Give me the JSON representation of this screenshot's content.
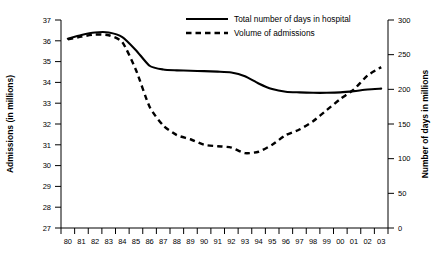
{
  "chart_data": {
    "type": "line",
    "title": "",
    "xlabel": "",
    "ylabel": "Admissions (in millions)",
    "y2label": "Number of days in millions",
    "categories": [
      "80",
      "81",
      "82",
      "83",
      "84",
      "85",
      "86",
      "87",
      "88",
      "89",
      "90",
      "91",
      "92",
      "93",
      "94",
      "95",
      "96",
      "97",
      "98",
      "99",
      "00",
      "01",
      "02",
      "03"
    ],
    "ylim": [
      27,
      37
    ],
    "y2lim": [
      0,
      300
    ],
    "yticks": [
      27,
      28,
      29,
      30,
      31,
      32,
      33,
      34,
      35,
      36,
      37
    ],
    "y2ticks": [
      0,
      50,
      100,
      150,
      200,
      250,
      300
    ],
    "grid": false,
    "legend_position": "top-center",
    "series": [
      {
        "name": "Total number of days in hospital",
        "axis": "left",
        "style": "solid",
        "color": "#000000",
        "values": [
          36.1,
          36.28,
          36.4,
          36.4,
          36.18,
          35.55,
          34.8,
          34.62,
          34.58,
          34.56,
          34.54,
          34.52,
          34.48,
          34.3,
          33.95,
          33.68,
          33.55,
          33.52,
          33.5,
          33.5,
          33.52,
          33.58,
          33.66,
          33.7
        ]
      },
      {
        "name": "Volume of admissions",
        "axis": "right",
        "style": "dashed",
        "color": "#000000",
        "values": [
          272,
          276,
          279,
          278,
          268,
          228,
          175,
          148,
          134,
          128,
          120,
          118,
          116,
          108,
          110,
          120,
          134,
          142,
          154,
          170,
          186,
          200,
          220,
          232
        ]
      }
    ]
  },
  "axes": {
    "left_title": "Admissions (in millions)",
    "right_title": "Number of days in millions",
    "x_tick_labels": [
      "80",
      "81",
      "82",
      "83",
      "84",
      "85",
      "86",
      "87",
      "88",
      "89",
      "90",
      "91",
      "92",
      "93",
      "94",
      "95",
      "96",
      "97",
      "98",
      "99",
      "00",
      "01",
      "02",
      "03"
    ],
    "left_tick_labels": [
      "37",
      "36",
      "35",
      "34",
      "33",
      "32",
      "31",
      "30",
      "29",
      "28",
      "27"
    ],
    "right_tick_labels": [
      "300",
      "250",
      "200",
      "150",
      "100",
      "50",
      "0"
    ]
  },
  "legend": {
    "items": [
      {
        "label": "Total number of days in hospital",
        "style": "solid"
      },
      {
        "label": "Volume of admissions",
        "style": "dashed"
      }
    ]
  }
}
